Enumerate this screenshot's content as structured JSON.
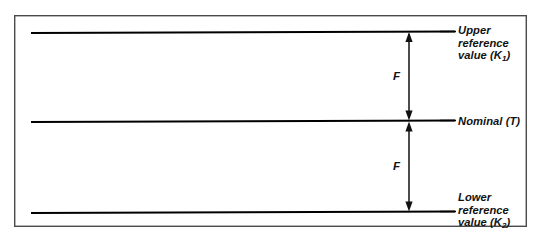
{
  "figure": {
    "type": "tolerance-reference-diagram",
    "background_color": "#ffffff",
    "line_color": "#000000",
    "frame_color": "#4a4a4a"
  },
  "frame": {
    "x": 14,
    "y": 15,
    "width": 513,
    "height": 212
  },
  "reference_lines": [
    {
      "id": "upper",
      "y": 32,
      "x_start": 31,
      "x_end": 455
    },
    {
      "id": "nominal",
      "y": 121,
      "x_start": 31,
      "x_end": 455
    },
    {
      "id": "lower",
      "y": 212,
      "x_start": 31,
      "x_end": 455
    }
  ],
  "dimension_line": {
    "x": 409,
    "spans": [
      {
        "id": "upper-span",
        "y_top": 32,
        "y_bottom": 121,
        "label": "F"
      },
      {
        "id": "lower-span",
        "y_top": 121,
        "y_bottom": 212,
        "label": "F"
      }
    ]
  },
  "labels": {
    "upper": {
      "line1": "Upper",
      "line2": "reference",
      "line3_prefix": "value (K",
      "line3_sub": "1",
      "line3_suffix": ")"
    },
    "nominal": {
      "text": "Nominal (T)"
    },
    "lower": {
      "line1": "Lower",
      "line2": "reference",
      "line3_prefix": "value (K",
      "line3_sub": "2",
      "line3_suffix": ")"
    },
    "dimension_upper": "F",
    "dimension_lower": "F"
  }
}
